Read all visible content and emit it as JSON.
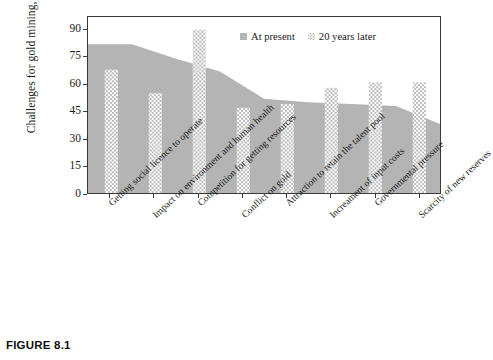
{
  "caption": "FIGURE 8.1",
  "legend": {
    "position": "top-right",
    "entries": [
      {
        "label": "At present",
        "marker": "solid-square-swatch",
        "color": "#b4b4b4"
      },
      {
        "label": "20 years later",
        "marker": "dotted-square-swatch",
        "color": "#b0b0b0"
      }
    ]
  },
  "axes": {
    "y_title": "Challenges for gold mining, %",
    "y_ticks": [
      "0",
      "15",
      "30",
      "45",
      "60",
      "75",
      "90"
    ]
  },
  "chart_data": {
    "type": "bar",
    "title": "",
    "subtitle": "",
    "xlabel": "",
    "ylabel": "Challenges for gold mining, %",
    "ylim": [
      0,
      97
    ],
    "yticks": [
      0,
      15,
      30,
      45,
      60,
      75,
      90
    ],
    "grid": false,
    "legend_position": "top-right",
    "categories": [
      "Getting social licence to operate",
      "Impact on environment and human health",
      "Competition for getting resources",
      "Conflict on gold",
      "Attraction to retain the talent pool",
      "Increament of input costs",
      "Governmental pressure",
      "Scarcity of new reserves"
    ],
    "series": [
      {
        "name": "At present",
        "render": "area",
        "color": "#b4b4b4",
        "values": [
          82,
          74,
          67,
          52,
          50,
          49,
          48,
          38
        ]
      },
      {
        "name": "20 years later",
        "render": "bar",
        "color": "#b0b0b0",
        "pattern": "checkerboard",
        "values": [
          68,
          55,
          90,
          47,
          49,
          58,
          61,
          61
        ]
      }
    ]
  }
}
